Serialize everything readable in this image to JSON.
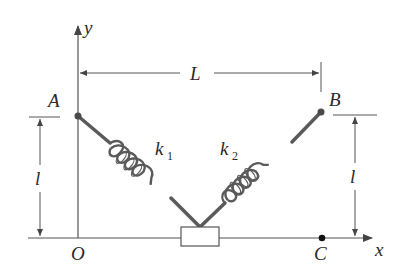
{
  "figure": {
    "colors": {
      "background": "#ffffff",
      "line": "#555555",
      "spring": "#5a5a5a",
      "rod": "#5a5a5a",
      "text": "#2a2a2a"
    },
    "labels": {
      "y_axis": "y",
      "x_axis": "x",
      "origin": "O",
      "point_a": "A",
      "point_b": "B",
      "point_c": "C",
      "length_L": "L",
      "height_left": "l",
      "height_right": "l",
      "spring1_k": "k",
      "spring1_sub": "1",
      "spring2_k": "k",
      "spring2_sub": "2"
    },
    "elements": {
      "spring_1": {
        "from": "A",
        "to": "block",
        "label": "k1"
      },
      "spring_2": {
        "from": "B",
        "to": "block",
        "label": "k2"
      },
      "block": {
        "position": "on x-axis between O and C"
      },
      "dimension_L": "horizontal distance from y-axis (A) to B",
      "dimension_l": "vertical height of A and B above x-axis"
    }
  }
}
